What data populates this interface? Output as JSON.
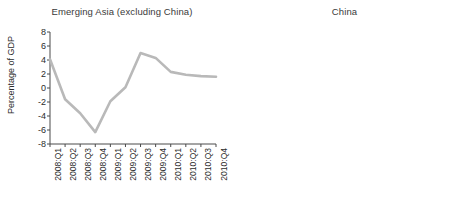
{
  "figure": {
    "background_color": "#ffffff",
    "line_color": "#b9b9b9",
    "axis_color": "#4a4a4a",
    "text_color": "#2b2b2b"
  },
  "chart_data": [
    {
      "type": "line",
      "title": "Emerging Asia (excluding China)",
      "xlabel": "",
      "ylabel": "Percentage of GDP",
      "ylim": [
        -8,
        8
      ],
      "yticks": [
        8,
        6,
        4,
        2,
        0,
        -2,
        -4,
        -6,
        -8
      ],
      "ytick_labels": [
        "8",
        "6",
        "4",
        "2",
        "0",
        "-2",
        "-4",
        "-6",
        "-8"
      ],
      "grid": false,
      "legend": "none",
      "categories": [
        "2008:Q1",
        "2008:Q2",
        "2008:Q3",
        "2008:Q4",
        "2009:Q1",
        "2009:Q2",
        "2009:Q3",
        "2009:Q4",
        "2010:Q1",
        "2010:Q2",
        "2010:Q3",
        "2010:Q4"
      ],
      "values": [
        4.1,
        -1.6,
        -3.6,
        -6.3,
        -1.9,
        0.1,
        5.0,
        4.3,
        2.3,
        1.9,
        1.7,
        1.6
      ]
    },
    {
      "type": "line",
      "title": "China",
      "xlabel": "",
      "ylabel": "",
      "ylim": [
        -8,
        8
      ],
      "yticks": [
        8,
        6,
        4,
        2,
        0,
        -2,
        -4,
        -6,
        -8
      ],
      "ytick_labels": [
        "8",
        "6",
        "4",
        "2",
        "0",
        "-2",
        "-4",
        "-6",
        "-8"
      ],
      "grid": false,
      "legend": "none",
      "categories": [
        "2007:H1",
        "2007:H2",
        "2008:H1",
        "2008:H2",
        "2009:H1",
        "2009:H2",
        "2010:Q1",
        "2010:Q2",
        "2010:Q3",
        "2010:Q4"
      ],
      "values": [
        6.0,
        -1.0,
        3.7,
        -2.1,
        2.7,
        2.8,
        5.0,
        2.3,
        0.8,
        6.2
      ]
    }
  ]
}
